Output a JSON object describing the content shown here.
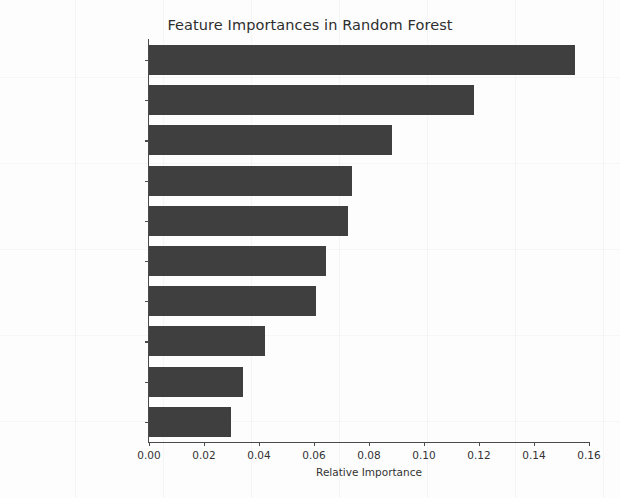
{
  "chart_data": {
    "type": "bar",
    "orientation": "horizontal",
    "title": "Feature Importances in Random Forest",
    "xlabel": "Relative Importance",
    "ylabel": "",
    "xlim": [
      0.0,
      0.16
    ],
    "grid": false,
    "legend": null,
    "bar_color": "#3f3f3f",
    "categories": [
      "src_bytes",
      "dst_bytes",
      "flag",
      "same_srv_rate",
      "last_flag",
      "dst_host_same_srv_rate",
      "dst_host_srv_count",
      "count",
      "\"diff_srv_rate\"",
      "logged_in"
    ],
    "values": [
      0.155,
      0.118,
      0.0884,
      0.0738,
      0.0724,
      0.0644,
      0.0607,
      0.0422,
      0.0342,
      0.0298
    ],
    "xticks": [
      0.0,
      0.02,
      0.04,
      0.06,
      0.08,
      0.1,
      0.12,
      0.14,
      0.16
    ],
    "xtick_labels": [
      "0.00",
      "0.02",
      "0.04",
      "0.06",
      "0.08",
      "0.10",
      "0.12",
      "0.14",
      "0.16"
    ]
  }
}
